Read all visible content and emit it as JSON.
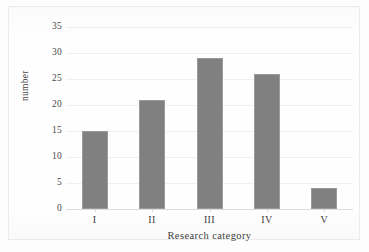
{
  "chart_data": {
    "type": "bar",
    "title": "",
    "subtitle": "",
    "categories": [
      "I",
      "II",
      "III",
      "IV",
      "V"
    ],
    "values": [
      15,
      21,
      29,
      26,
      4
    ],
    "series": [
      {
        "name": "number",
        "values": [
          15,
          21,
          29,
          26,
          4
        ]
      }
    ],
    "xlabel": "Research category",
    "ylabel": "number",
    "ylim": [
      0,
      35
    ],
    "ytick_labels": [
      "0",
      "5",
      "10",
      "15",
      "20",
      "25",
      "30",
      "35"
    ],
    "ytick_values": [
      0,
      5,
      10,
      15,
      20,
      25,
      30,
      35
    ],
    "grid": "horizontal",
    "legend": "none",
    "bar_color": "#808080",
    "gridline_color": "#f0f0f0",
    "axis_color": "#dcdcdc",
    "text_color": "#3f3f3f",
    "frame_color": "#ebebeb",
    "background_color": "#fefefe"
  }
}
